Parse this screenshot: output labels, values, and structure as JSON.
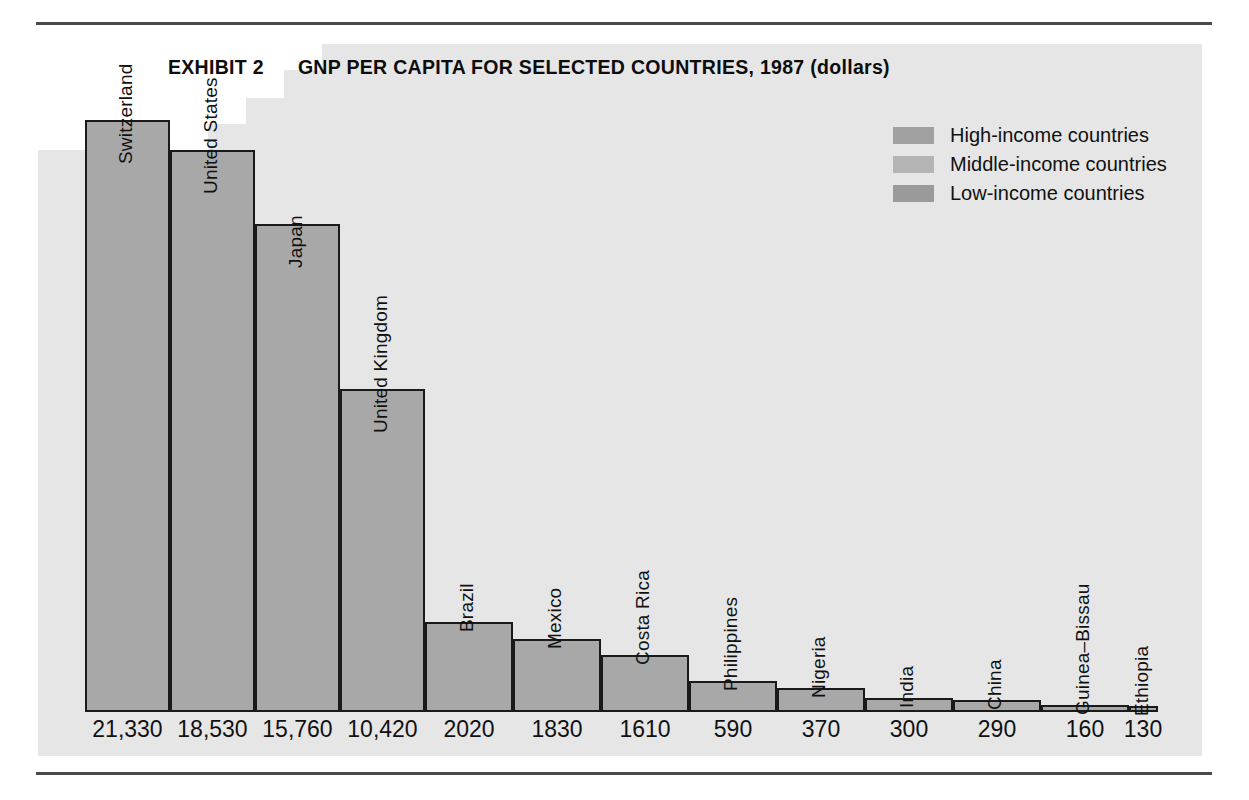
{
  "exhibit": {
    "number_label": "EXHIBIT 2",
    "title": "GNP PER CAPITA FOR SELECTED COUNTRIES, 1987 (dollars)"
  },
  "legend": {
    "items": [
      {
        "label": "High-income countries",
        "color": "#a0a0a0",
        "group": "high"
      },
      {
        "label": "Middle-income countries",
        "color": "#b4b4b4",
        "group": "middle"
      },
      {
        "label": "Low-income countries",
        "color": "#9a9a9a",
        "group": "low"
      }
    ]
  },
  "colors": {
    "bar_fill": "#a8a8a8",
    "bar_stroke": "#1a1a1a",
    "panel": "#e6e6e6",
    "rule": "#4a4a4a",
    "text": "#111111"
  },
  "chart_data": {
    "type": "bar",
    "title": "GNP PER CAPITA FOR SELECTED COUNTRIES, 1987 (dollars)",
    "xlabel": "",
    "ylabel": "GNP per capita (dollars)",
    "grid": false,
    "legend_position": "top-right",
    "categories": [
      "Switzerland",
      "United States",
      "Japan",
      "United Kingdom",
      "Brazil",
      "Mexico",
      "Costa Rica",
      "Philippines",
      "Nigeria",
      "India",
      "China",
      "Guinea–Bissau",
      "Ethiopia"
    ],
    "values": [
      21330,
      18530,
      15760,
      10420,
      2020,
      1830,
      1610,
      590,
      370,
      300,
      290,
      160,
      130
    ],
    "value_labels": [
      "21,330",
      "18,530",
      "15,760",
      "10,420",
      "2020",
      "1830",
      "1610",
      "590",
      "370",
      "300",
      "290",
      "160",
      "130"
    ],
    "groups": [
      "high",
      "high",
      "high",
      "high",
      "middle",
      "middle",
      "middle",
      "middle",
      "low",
      "low",
      "low",
      "low",
      "low"
    ],
    "ylim": [
      0,
      21330
    ],
    "bars": [
      {
        "name": "Switzerland",
        "value": 21330,
        "value_label": "21,330",
        "group": "high",
        "x": 0,
        "w": 85,
        "h_pct": 100.0,
        "label_inside": true
      },
      {
        "name": "United States",
        "value": 18530,
        "value_label": "18,530",
        "group": "high",
        "x": 85,
        "w": 85,
        "h_pct": 95.0,
        "label_inside": true
      },
      {
        "name": "Japan",
        "value": 15760,
        "value_label": "15,760",
        "group": "high",
        "x": 170,
        "w": 85,
        "h_pct": 82.5,
        "label_inside": true
      },
      {
        "name": "United Kingdom",
        "value": 10420,
        "value_label": "10,420",
        "group": "high",
        "x": 255,
        "w": 85,
        "h_pct": 54.5,
        "label_inside": true
      },
      {
        "name": "Brazil",
        "value": 2020,
        "value_label": "2020",
        "group": "middle",
        "x": 340,
        "w": 88,
        "h_pct": 15.2,
        "label_inside": false
      },
      {
        "name": "Mexico",
        "value": 1830,
        "value_label": "1830",
        "group": "middle",
        "x": 428,
        "w": 88,
        "h_pct": 12.3,
        "label_inside": false
      },
      {
        "name": "Costa Rica",
        "value": 1610,
        "value_label": "1610",
        "group": "middle",
        "x": 516,
        "w": 88,
        "h_pct": 9.6,
        "label_inside": false
      },
      {
        "name": "Philippines",
        "value": 590,
        "value_label": "590",
        "group": "middle",
        "x": 604,
        "w": 88,
        "h_pct": 5.3,
        "label_inside": false
      },
      {
        "name": "Nigeria",
        "value": 370,
        "value_label": "370",
        "group": "low",
        "x": 692,
        "w": 88,
        "h_pct": 4.1,
        "label_inside": false
      },
      {
        "name": "India",
        "value": 300,
        "value_label": "300",
        "group": "low",
        "x": 780,
        "w": 88,
        "h_pct": 2.4,
        "label_inside": false
      },
      {
        "name": "China",
        "value": 290,
        "value_label": "290",
        "group": "low",
        "x": 868,
        "w": 88,
        "h_pct": 2.0,
        "label_inside": false
      },
      {
        "name": "Guinea–Bissau",
        "value": 160,
        "value_label": "160",
        "group": "low",
        "x": 956,
        "w": 88,
        "h_pct": 1.2,
        "label_inside": false
      },
      {
        "name": "Ethiopia",
        "value": 130,
        "value_label": "130",
        "group": "low",
        "x": 1044,
        "w": 29,
        "h_pct": 0.9,
        "label_inside": false
      }
    ]
  }
}
